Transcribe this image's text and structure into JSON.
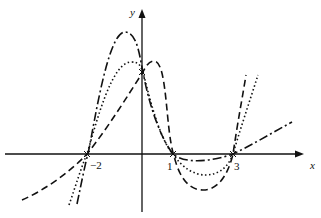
{
  "figure": {
    "axes": {
      "x_label": "x",
      "y_label": "y",
      "x_ticks": [
        {
          "value": -2,
          "label": "−2"
        },
        {
          "value": 1,
          "label": "1"
        },
        {
          "value": 3,
          "label": "3"
        }
      ]
    },
    "curves": [
      {
        "name": "dash-dot-curve",
        "style": "dash-dot",
        "description": "cubic-like curve through (-2,0), (1,0), (3,0) with tall peak left of y-axis, linear rise after x=3"
      },
      {
        "name": "dotted-curve",
        "style": "dotted",
        "description": "curve through (-2,0), (1,0), (3,0) with moderate peak left of y-axis and dip between 1 and 3"
      },
      {
        "name": "dashed-curve",
        "style": "dashed",
        "description": "curve through (-2,0), (1,0), (3,0) with peak right of y-axis and deep dip between 1 and 3"
      }
    ],
    "colors": {
      "ink": "#111111",
      "background": "#ffffff"
    }
  }
}
